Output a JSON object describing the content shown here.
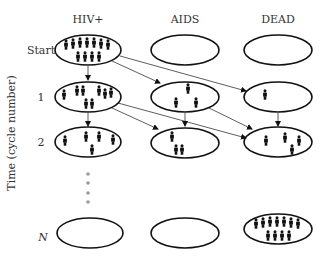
{
  "columns": [
    {
      "key": "hiv",
      "label": "HIV+",
      "cx": 88
    },
    {
      "key": "aids",
      "label": "AIDS",
      "cx": 185
    },
    {
      "key": "dead",
      "label": "DEAD",
      "cx": 278
    }
  ],
  "rows": [
    {
      "label": "Start",
      "italic": false,
      "cy": 50
    },
    {
      "label": "1",
      "italic": false,
      "cy": 97
    },
    {
      "label": "2",
      "italic": false,
      "cy": 142
    },
    {
      "label": "N",
      "italic": true,
      "cy": 237
    }
  ],
  "y_axis_label": "Time (cycle number)",
  "states": {
    "start": {
      "hiv": 11,
      "aids": 0,
      "dead": 0
    },
    "cycle_1": {
      "hiv": 8,
      "aids": 3,
      "dead": 1
    },
    "cycle_2": {
      "hiv": 5,
      "aids": 3,
      "dead": 4
    },
    "cycle_N": {
      "hiv": 0,
      "aids": 0,
      "dead": 11
    }
  },
  "transitions": [
    {
      "from": "Start.HIV+",
      "to": "1.HIV+"
    },
    {
      "from": "Start.HIV+",
      "to": "1.AIDS"
    },
    {
      "from": "Start.HIV+",
      "to": "1.DEAD"
    },
    {
      "from": "1.HIV+",
      "to": "2.HIV+"
    },
    {
      "from": "1.HIV+",
      "to": "2.AIDS"
    },
    {
      "from": "1.HIV+",
      "to": "2.DEAD"
    },
    {
      "from": "1.AIDS",
      "to": "2.AIDS"
    },
    {
      "from": "1.AIDS",
      "to": "2.DEAD"
    },
    {
      "from": "1.DEAD",
      "to": "2.DEAD"
    }
  ],
  "ellipsis_dots": 4,
  "colors": {
    "stroke": "#111111",
    "text": "#333333",
    "dots": "#999999",
    "background": "#ffffff"
  }
}
